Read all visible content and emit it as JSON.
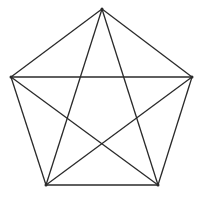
{
  "diagram": {
    "type": "pentagon-with-pentagram",
    "stroke_color": "#2a2a2a",
    "background": "#ffffff",
    "vertices": [
      {
        "name": "top",
        "x": 102,
        "y": 9
      },
      {
        "name": "right",
        "x": 192,
        "y": 77
      },
      {
        "name": "bottom-right",
        "x": 158,
        "y": 185
      },
      {
        "name": "bottom-left",
        "x": 46,
        "y": 185
      },
      {
        "name": "left",
        "x": 11,
        "y": 77
      }
    ]
  }
}
